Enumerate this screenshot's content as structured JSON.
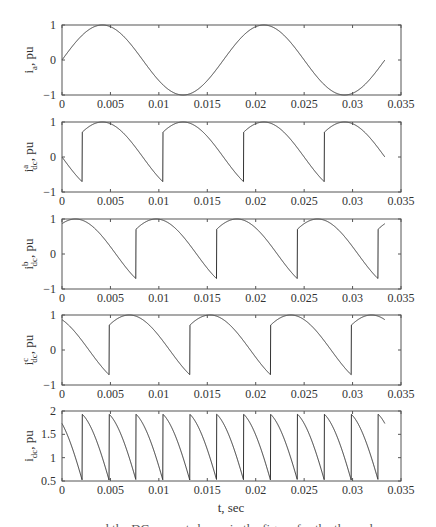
{
  "figure": {
    "xlabel": "t, sec",
    "caption_fragment": "and  the  DC  current  shown  in  the  figure  for  the  three  phases"
  },
  "chart_data": [
    {
      "type": "line",
      "id": "ia",
      "ylabel": {
        "base": "i",
        "sub": "a",
        "sup": "",
        "suffix": ", pu"
      },
      "xlim": [
        0,
        0.035
      ],
      "ylim": [
        -1,
        1
      ],
      "xticks": [
        0,
        0.005,
        0.01,
        0.015,
        0.02,
        0.025,
        0.03,
        0.035
      ],
      "xtick_labels": [
        "0",
        "0.005",
        "0.01",
        "0.015",
        "0.02",
        "0.025",
        "0.03",
        "0.035"
      ],
      "yticks": [
        -1,
        0,
        1
      ],
      "ytick_labels": [
        "−1",
        "0",
        "1"
      ],
      "grid": false,
      "model": {
        "kind": "sine",
        "freq_hz": 60,
        "phase_deg": 0,
        "t_end": 0.03333
      },
      "key_points": {
        "x": [
          0,
          0.00417,
          0.0125,
          0.02083,
          0.02917,
          0.03333
        ],
        "y": [
          0,
          1,
          -1,
          1,
          -1,
          0
        ]
      }
    },
    {
      "type": "line",
      "id": "idc_a",
      "ylabel": {
        "base": "i",
        "sub": "dc",
        "sup": "a",
        "suffix": ", pu"
      },
      "xlim": [
        0,
        0.035
      ],
      "ylim": [
        -1,
        1
      ],
      "xticks": [
        0,
        0.005,
        0.01,
        0.015,
        0.02,
        0.025,
        0.03,
        0.035
      ],
      "xtick_labels": [
        "0",
        "0.005",
        "0.01",
        "0.015",
        "0.02",
        "0.025",
        "0.03",
        "0.035"
      ],
      "yticks": [
        -1,
        0,
        1
      ],
      "ytick_labels": [
        "−1",
        "0",
        "1"
      ],
      "grid": false,
      "model": {
        "kind": "switched_sine",
        "freq_hz": 60,
        "shift_deg": 0,
        "t_end": 0.03333
      },
      "key_points": {
        "x": [
          0,
          0.00208,
          0.00208,
          0.00417,
          0.01042,
          0.01042,
          0.0125,
          0.01875,
          0.01875,
          0.02083,
          0.02708,
          0.02708,
          0.02917,
          0.03333
        ],
        "y": [
          0,
          -0.71,
          0.71,
          1,
          -0.71,
          0.71,
          1,
          -0.71,
          0.71,
          1,
          -0.71,
          0.71,
          1,
          0
        ]
      }
    },
    {
      "type": "line",
      "id": "idc_b",
      "ylabel": {
        "base": "i",
        "sub": "dc",
        "sup": "b",
        "suffix": ", pu"
      },
      "xlim": [
        0,
        0.035
      ],
      "ylim": [
        -1,
        1
      ],
      "xticks": [
        0,
        0.005,
        0.01,
        0.015,
        0.02,
        0.025,
        0.03,
        0.035
      ],
      "xtick_labels": [
        "0",
        "0.005",
        "0.01",
        "0.015",
        "0.02",
        "0.025",
        "0.03",
        "0.035"
      ],
      "yticks": [
        -1,
        0,
        1
      ],
      "ytick_labels": [
        "−1",
        "0",
        "1"
      ],
      "grid": false,
      "model": {
        "kind": "switched_sine",
        "freq_hz": 60,
        "shift_deg": 120,
        "t_end": 0.03333
      },
      "key_points": {
        "x": [
          0,
          0.00139,
          0.00764,
          0.00764,
          0.00972,
          0.01597,
          0.01597,
          0.01806,
          0.02431,
          0.02431,
          0.02639,
          0.03264,
          0.03264,
          0.03333
        ],
        "y": [
          0.87,
          1,
          -0.71,
          0.71,
          1,
          -0.71,
          0.71,
          1,
          -0.71,
          0.71,
          1,
          -0.71,
          0.71,
          0.87
        ]
      }
    },
    {
      "type": "line",
      "id": "idc_c",
      "ylabel": {
        "base": "i",
        "sub": "dc",
        "sup": "c",
        "suffix": ", pu"
      },
      "xlim": [
        0,
        0.035
      ],
      "ylim": [
        -1,
        1
      ],
      "xticks": [
        0,
        0.005,
        0.01,
        0.015,
        0.02,
        0.025,
        0.03,
        0.035
      ],
      "xtick_labels": [
        "0",
        "0.005",
        "0.01",
        "0.015",
        "0.02",
        "0.025",
        "0.03",
        "0.035"
      ],
      "yticks": [
        -1,
        0,
        1
      ],
      "ytick_labels": [
        "−1",
        "0",
        "1"
      ],
      "grid": false,
      "model": {
        "kind": "switched_sine",
        "freq_hz": 60,
        "shift_deg": 60,
        "t_end": 0.03333
      },
      "key_points": {
        "x": [
          0,
          0.00486,
          0.00486,
          0.00694,
          0.01319,
          0.01319,
          0.01528,
          0.02153,
          0.02153,
          0.02361,
          0.02986,
          0.02986,
          0.03194,
          0.03333
        ],
        "y": [
          0.87,
          -0.71,
          0.71,
          1,
          -0.71,
          0.71,
          1,
          -0.71,
          0.71,
          1,
          -0.71,
          0.71,
          1,
          0.87
        ]
      }
    },
    {
      "type": "line",
      "id": "idc",
      "ylabel": {
        "base": "i",
        "sub": "dc",
        "sup": "",
        "suffix": ", pu"
      },
      "xlim": [
        0,
        0.035
      ],
      "ylim": [
        0.5,
        2
      ],
      "xticks": [
        0,
        0.005,
        0.01,
        0.015,
        0.02,
        0.025,
        0.03,
        0.035
      ],
      "xtick_labels": [
        "0",
        "0.005",
        "0.01",
        "0.015",
        "0.02",
        "0.025",
        "0.03",
        "0.035"
      ],
      "yticks": [
        0.5,
        1,
        1.5,
        2
      ],
      "ytick_labels": [
        "0.5",
        "1",
        "1.5",
        "2"
      ],
      "grid": false,
      "model": {
        "kind": "sum",
        "of": [
          "idc_a",
          "idc_b",
          "idc_c"
        ],
        "t_end": 0.03333
      },
      "key_points": {
        "note_pulse_period_s": 0.00278,
        "x": [
          0,
          0.00208,
          0.00208,
          0.00486,
          0.00486,
          0.00764,
          0.00764,
          0.01042,
          0.01042,
          0.03264,
          0.03264,
          0.03333
        ],
        "y": [
          1.73,
          0.52,
          1.93,
          0.52,
          1.93,
          0.52,
          1.93,
          0.52,
          1.93,
          0.52,
          1.93,
          1.73
        ]
      }
    }
  ]
}
